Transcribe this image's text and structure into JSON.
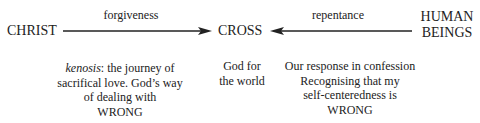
{
  "nodes": {
    "christ": "CHRIST",
    "cross": "CROSS",
    "human_line1": "HUMAN",
    "human_line2": "BEINGS"
  },
  "edges": {
    "left": {
      "label": "forgiveness",
      "from": "CHRIST",
      "to": "CROSS"
    },
    "right": {
      "label": "repentance",
      "from": "HUMAN BEINGS",
      "to": "CROSS"
    }
  },
  "descriptions": {
    "left": {
      "italic_term": "kenosis",
      "line1_rest": ": the journey of",
      "line2": "sacrifical love. God’s way",
      "line3": "of dealing with",
      "line4": "WRONG"
    },
    "center": {
      "line1": "God for",
      "line2": "the world"
    },
    "right": {
      "line1": "Our response in confession",
      "line2": "Recognising that my",
      "line3": "self-centeredness is",
      "line4": "WRONG"
    }
  }
}
